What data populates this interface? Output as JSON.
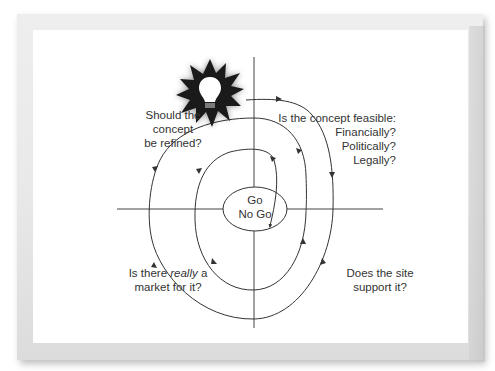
{
  "diagram": {
    "type": "spiral-decision-cycle",
    "center": {
      "line1": "Go",
      "line2": "No Go"
    },
    "quadrants": {
      "top_left": {
        "lines": [
          "Should the",
          "concept",
          "be refined?"
        ]
      },
      "top_right": {
        "lines": [
          "Is the concept feasible:",
          "Financially?",
          "Politically?",
          "Legally?"
        ]
      },
      "bottom_left": {
        "prefix": "Is there ",
        "emphasis": "really",
        "suffix": " a",
        "line2": "market for it?"
      },
      "bottom_right": {
        "lines": [
          "Does the site",
          "support it?"
        ]
      }
    },
    "start_icon": "lightbulb-starburst-icon",
    "colors": {
      "line": "#333333",
      "starburst": "#1a1a1a",
      "bulb": "#ffffff",
      "text": "#333333",
      "frame": "#e8e8e8"
    }
  }
}
